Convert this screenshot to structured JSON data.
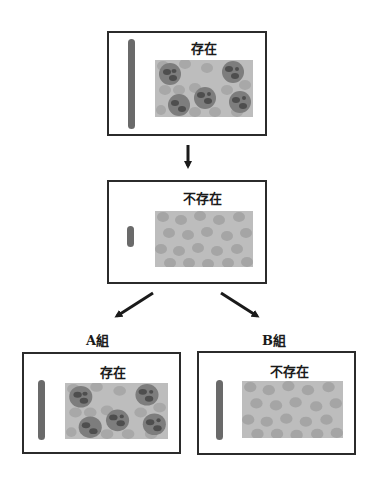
{
  "panels": {
    "top": {
      "label": "存在",
      "state": "present"
    },
    "middle": {
      "label": "不存在",
      "state": "absent"
    },
    "group_a": {
      "group_label": "A組",
      "label": "存在",
      "state": "present"
    },
    "group_b": {
      "group_label": "B組",
      "label": "不存在",
      "state": "absent"
    }
  },
  "colors": {
    "border": "#2b2b2b",
    "bar": "#6a6a6a",
    "tissue_bg": "#bdbdbd",
    "rbc": "#a8a8a8",
    "cell_body": "#7d7d7d",
    "cell_nucleus": "#4e4e4e",
    "arrow": "#1a1a1a"
  }
}
